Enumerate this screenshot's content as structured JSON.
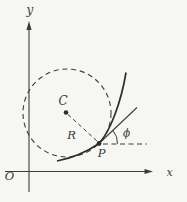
{
  "figure": {
    "background_color": "#f6f6f3",
    "ink_color": "#3c3c3c",
    "curve_color": "#2e2e2e",
    "labels": {
      "y_axis": "y",
      "x_axis": "x",
      "origin": "O",
      "circle_center": "C",
      "radius": "R",
      "point": "P",
      "angle": "ϕ"
    }
  }
}
